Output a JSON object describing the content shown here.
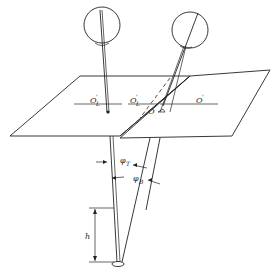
{
  "figure": {
    "labels": {
      "o_left": "O",
      "o_left_sub": "L",
      "o_left_sup": "'",
      "o_mid": "O",
      "o_mid_sub": "L",
      "o_mid_sup": "'",
      "o_center": "O",
      "o_right": "O",
      "o_right_sup": "'",
      "phi_t": "φ",
      "phi_t_sub": "T",
      "phi_b": "φ",
      "phi_b_sub": "B",
      "h": "h"
    },
    "colors": {
      "line": "#222222",
      "background": "#ffffff"
    }
  }
}
